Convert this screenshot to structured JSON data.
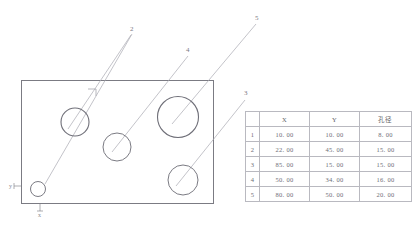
{
  "drawing": {
    "plate": {
      "name": "rectangular-plate-outline",
      "x": 21,
      "y": 80,
      "width": 193,
      "height": 124
    },
    "axes": {
      "x_label": "x",
      "y_label": "y",
      "origin_x": 21,
      "origin_y": 204
    },
    "holes": [
      {
        "id": "1",
        "label": "1",
        "cx": 38,
        "cy": 189,
        "r": 7.5,
        "leader_x": 132,
        "leader_y": 32
      },
      {
        "id": "2",
        "label": "2",
        "cx": 75,
        "cy": 122,
        "r": 14.0,
        "leader_x": 132,
        "leader_y": 32
      },
      {
        "id": "3",
        "label": "3",
        "cx": 183,
        "cy": 180,
        "r": 15.0,
        "leader_x": 246,
        "leader_y": 96
      },
      {
        "id": "4",
        "label": "4",
        "cx": 117,
        "cy": 147,
        "r": 14.0,
        "leader_x": 188,
        "leader_y": 53
      },
      {
        "id": "5",
        "label": "5",
        "cx": 178,
        "cy": 117,
        "r": 20.5,
        "leader_x": 257,
        "leader_y": 21
      }
    ],
    "corner_mark": {
      "name": "corner-datum-mark",
      "x": 93,
      "y": 93
    },
    "line_color": "#7b7b83",
    "leader_color": "#a9a9b2"
  },
  "table": {
    "columns": [
      "",
      "X",
      "Y",
      "孔径"
    ],
    "rows": [
      {
        "index": "1",
        "x": "10. 00",
        "y": "10. 00",
        "diameter": "8. 00"
      },
      {
        "index": "2",
        "x": "22. 00",
        "y": "45. 00",
        "diameter": "15. 00"
      },
      {
        "index": "3",
        "x": "85. 00",
        "y": "15. 00",
        "diameter": "15. 00"
      },
      {
        "index": "4",
        "x": "50. 00",
        "y": "34. 00",
        "diameter": "16. 00"
      },
      {
        "index": "5",
        "x": "80. 00",
        "y": "50. 00",
        "diameter": "20. 00"
      }
    ]
  }
}
